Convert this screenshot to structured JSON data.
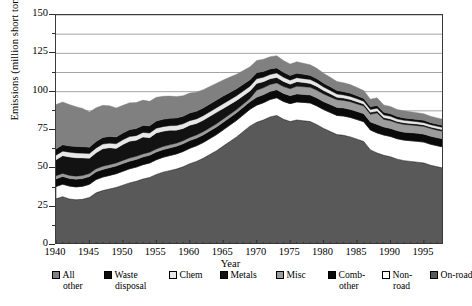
{
  "chart_data": {
    "type": "area",
    "title": "",
    "xlabel": "Year",
    "ylabel": "Emissions (million short tons)",
    "stacked": true,
    "grid": true,
    "legend_position": "bottom",
    "xlim": [
      1940,
      1998
    ],
    "ylim": [
      0,
      150
    ],
    "ytick_major": [
      0,
      25,
      50,
      75,
      100,
      125,
      150
    ],
    "ytick_minor_step": 12.5,
    "ytick_labels": [
      "0",
      "25",
      "50",
      "75",
      "100",
      "125",
      "150"
    ],
    "xtick_labels": [
      "1940",
      "1945",
      "1950",
      "1955",
      "1960",
      "1965",
      "1970",
      "1975",
      "1980",
      "1985",
      "1990",
      "1995"
    ],
    "xtick_step_minor": 1,
    "x": [
      1940,
      1941,
      1942,
      1943,
      1944,
      1945,
      1946,
      1947,
      1948,
      1949,
      1950,
      1951,
      1952,
      1953,
      1954,
      1955,
      1956,
      1957,
      1958,
      1959,
      1960,
      1961,
      1962,
      1963,
      1964,
      1965,
      1966,
      1967,
      1968,
      1969,
      1970,
      1971,
      1972,
      1973,
      1974,
      1975,
      1976,
      1977,
      1978,
      1979,
      1980,
      1981,
      1982,
      1983,
      1984,
      1985,
      1986,
      1987,
      1988,
      1989,
      1990,
      1991,
      1992,
      1993,
      1994,
      1995,
      1996,
      1997,
      1998
    ],
    "series": [
      {
        "name": "On-road",
        "color": "#595959",
        "order": 1,
        "values": [
          30.1,
          31.5,
          30.0,
          29.5,
          29.8,
          31.0,
          34.0,
          35.5,
          36.5,
          37.5,
          39.0,
          40.5,
          41.5,
          43.0,
          44.0,
          46.0,
          47.5,
          48.5,
          49.5,
          51.0,
          53.0,
          54.5,
          56.5,
          59.0,
          61.5,
          64.5,
          67.5,
          70.5,
          74.0,
          77.5,
          80.0,
          81.5,
          83.5,
          84.5,
          82.0,
          80.5,
          81.5,
          81.0,
          80.5,
          78.5,
          76.0,
          74.0,
          72.0,
          71.5,
          70.5,
          69.0,
          67.5,
          62.0,
          60.0,
          58.5,
          57.5,
          56.0,
          55.0,
          54.5,
          54.0,
          53.5,
          52.0,
          51.0,
          50.0
        ]
      },
      {
        "name": "Non-road",
        "color": "#ffffff",
        "order": 2,
        "values": [
          8.0,
          8.2,
          8.4,
          8.4,
          8.5,
          8.6,
          8.7,
          8.8,
          8.9,
          9.0,
          9.1,
          9.2,
          9.3,
          9.4,
          9.5,
          9.6,
          9.7,
          9.8,
          9.9,
          10.0,
          10.1,
          10.2,
          10.3,
          10.4,
          10.5,
          10.6,
          10.7,
          10.8,
          10.9,
          11.0,
          11.2,
          11.3,
          11.4,
          11.5,
          11.6,
          11.7,
          11.8,
          12.0,
          12.1,
          12.2,
          12.3,
          12.4,
          12.5,
          12.6,
          12.7,
          12.8,
          12.9,
          13.0,
          13.1,
          13.2,
          13.3,
          13.3,
          13.4,
          13.5,
          13.6,
          13.6,
          13.7,
          13.7,
          13.8
        ]
      },
      {
        "name": "Comb-other",
        "color": "#0a0a0a",
        "order": 3,
        "values": [
          5.0,
          5.0,
          5.0,
          5.0,
          5.0,
          5.0,
          5.0,
          5.0,
          5.0,
          5.0,
          5.0,
          5.0,
          5.0,
          5.0,
          5.0,
          5.0,
          5.0,
          5.0,
          5.0,
          5.0,
          5.0,
          5.0,
          5.0,
          5.0,
          5.0,
          5.0,
          5.0,
          5.0,
          5.0,
          5.0,
          5.2,
          5.2,
          5.2,
          5.2,
          5.2,
          5.2,
          5.2,
          5.2,
          5.2,
          5.2,
          5.2,
          5.2,
          5.2,
          5.2,
          5.2,
          5.2,
          5.2,
          5.2,
          5.5,
          5.2,
          5.2,
          5.2,
          5.2,
          5.2,
          5.2,
          5.2,
          5.2,
          5.2,
          5.2
        ]
      },
      {
        "name": "Misc",
        "color": "#9c9c9c",
        "order": 4,
        "values": [
          2.0,
          2.0,
          2.0,
          2.0,
          2.0,
          2.0,
          2.0,
          2.0,
          2.0,
          2.0,
          2.0,
          2.0,
          2.0,
          2.0,
          2.0,
          2.0,
          2.0,
          2.0,
          2.0,
          2.0,
          2.0,
          2.0,
          2.0,
          2.0,
          2.0,
          2.0,
          2.0,
          2.0,
          2.0,
          2.0,
          4.5,
          4.5,
          4.5,
          4.5,
          4.5,
          4.5,
          5.0,
          5.0,
          5.0,
          5.0,
          5.0,
          5.0,
          5.0,
          5.0,
          5.0,
          5.0,
          5.0,
          5.0,
          7.5,
          5.0,
          5.0,
          5.0,
          5.0,
          5.0,
          5.0,
          5.0,
          5.0,
          5.0,
          5.0
        ]
      },
      {
        "name": "Metals",
        "color": "#121212",
        "order": 5,
        "values": [
          10.5,
          11.5,
          12.0,
          12.0,
          11.5,
          10.0,
          10.5,
          11.5,
          11.0,
          9.5,
          10.5,
          11.0,
          10.5,
          11.0,
          9.5,
          10.5,
          10.0,
          9.5,
          8.5,
          8.0,
          8.0,
          7.5,
          7.5,
          7.5,
          7.5,
          7.0,
          6.5,
          6.0,
          5.5,
          5.0,
          4.5,
          4.0,
          3.8,
          3.6,
          3.4,
          3.0,
          3.0,
          2.8,
          2.6,
          2.5,
          2.2,
          2.0,
          1.6,
          1.5,
          1.5,
          1.4,
          1.3,
          1.3,
          1.3,
          1.2,
          1.2,
          1.1,
          1.1,
          1.1,
          1.1,
          1.0,
          1.0,
          1.0,
          1.0
        ]
      },
      {
        "name": "Chem",
        "color": "#e8e8e8",
        "order": 6,
        "values": [
          3.0,
          3.0,
          3.1,
          3.1,
          3.1,
          3.0,
          3.0,
          3.0,
          3.0,
          3.0,
          3.0,
          3.0,
          3.0,
          3.0,
          3.0,
          3.0,
          3.0,
          3.0,
          3.0,
          3.0,
          3.0,
          3.0,
          3.0,
          3.0,
          3.0,
          3.0,
          3.0,
          3.0,
          3.0,
          3.0,
          3.0,
          2.9,
          2.8,
          2.8,
          2.7,
          2.6,
          2.6,
          2.5,
          2.5,
          2.4,
          2.3,
          2.2,
          2.1,
          2.0,
          2.0,
          1.9,
          1.8,
          1.8,
          1.8,
          1.7,
          1.7,
          1.6,
          1.6,
          1.6,
          1.5,
          1.5,
          1.5,
          1.5,
          1.5
        ]
      },
      {
        "name": "Waste disposal",
        "color": "#0d0d0d",
        "order": 7,
        "values": [
          4.0,
          4.1,
          4.1,
          4.2,
          4.2,
          4.2,
          4.3,
          4.3,
          4.4,
          4.4,
          4.5,
          4.5,
          4.6,
          4.6,
          4.7,
          4.7,
          4.8,
          4.8,
          4.9,
          4.9,
          5.0,
          5.0,
          5.0,
          5.0,
          5.0,
          5.0,
          4.8,
          4.6,
          4.4,
          4.2,
          4.0,
          3.8,
          3.6,
          3.4,
          3.2,
          3.0,
          2.9,
          2.8,
          2.7,
          2.6,
          2.5,
          2.4,
          2.3,
          2.2,
          2.1,
          2.0,
          1.9,
          1.8,
          1.8,
          1.7,
          1.7,
          1.6,
          1.6,
          1.5,
          1.5,
          1.5,
          1.4,
          1.4,
          1.4
        ]
      },
      {
        "name": "All other",
        "color": "#808080",
        "order": 8,
        "values": [
          29.0,
          28.0,
          27.0,
          26.0,
          25.0,
          23.0,
          22.0,
          21.0,
          20.0,
          19.0,
          18.0,
          17.5,
          17.0,
          16.5,
          16.0,
          15.5,
          15.0,
          14.5,
          14.0,
          13.5,
          13.0,
          12.5,
          12.0,
          11.5,
          11.0,
          10.5,
          10.0,
          9.5,
          9.0,
          8.5,
          8.0,
          8.0,
          8.0,
          8.0,
          7.8,
          7.5,
          7.5,
          7.2,
          7.0,
          6.8,
          6.5,
          6.2,
          6.0,
          5.8,
          5.6,
          5.4,
          5.2,
          5.0,
          5.0,
          4.8,
          4.8,
          4.6,
          4.6,
          4.5,
          4.4,
          4.3,
          4.2,
          4.1,
          4.0
        ]
      }
    ],
    "totals": [
      91.6,
      93.3,
      91.6,
      90.2,
      89.1,
      86.8,
      89.5,
      91.1,
      90.8,
      89.4,
      91.1,
      92.7,
      93.0,
      95.5,
      93.7,
      96.3,
      97.0,
      97.1,
      96.8,
      97.4,
      99.1,
      99.7,
      101.3,
      103.4,
      105.5,
      107.6,
      109.5,
      111.4,
      113.8,
      116.2,
      120.4,
      121.2,
      123.8,
      125.5,
      120.4,
      118.0,
      119.5,
      118.5,
      117.6,
      115.2,
      112.0,
      109.4,
      106.7,
      105.8,
      104.6,
      102.7,
      100.8,
      94.1,
      95.0,
      91.3,
      90.4,
      88.4,
      87.5,
      86.9,
      86.3,
      85.6,
      84.0,
      82.9,
      81.9
    ]
  },
  "axis": {
    "ylabel": "Emissions (million short tons)",
    "xlabel": "Year",
    "ytick_labels": [
      "150",
      "125",
      "100",
      "75",
      "50",
      "25",
      "0"
    ],
    "xtick_labels": [
      "1940",
      "1945",
      "1950",
      "1955",
      "1960",
      "1965",
      "1970",
      "1975",
      "1980",
      "1985",
      "1990",
      "1995"
    ]
  },
  "legend": {
    "items": [
      {
        "line1": "All",
        "line2": "other",
        "swatch": "#808080"
      },
      {
        "line1": "Waste",
        "line2": "disposal",
        "swatch": "#0d0d0d"
      },
      {
        "line1": "Chem",
        "line2": "",
        "swatch": "#e8e8e8"
      },
      {
        "line1": "Metals",
        "line2": "",
        "swatch": "#121212"
      },
      {
        "line1": "Misc",
        "line2": "",
        "swatch": "#9c9c9c"
      },
      {
        "line1": "Comb-",
        "line2": "other",
        "swatch": "#0a0a0a"
      },
      {
        "line1": "Non-",
        "line2": "road",
        "swatch": "#ffffff"
      },
      {
        "line1": "On-road",
        "line2": "",
        "swatch": "#595959"
      }
    ]
  }
}
